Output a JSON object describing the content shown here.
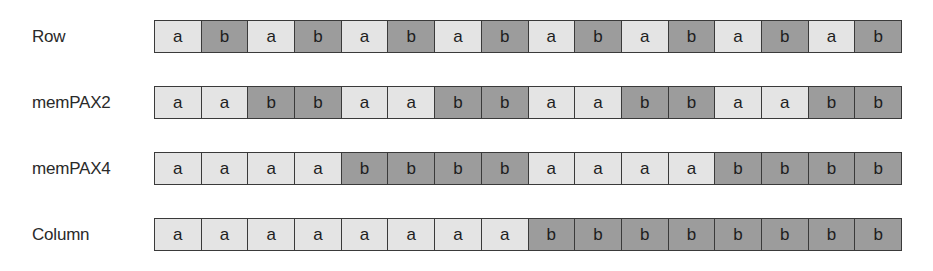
{
  "diagram": {
    "colors": {
      "a": "#e4e4e4",
      "b": "#9c9c9c",
      "border": "#3a3a3a"
    },
    "rows": [
      {
        "label": "Row",
        "cells": [
          "a",
          "b",
          "a",
          "b",
          "a",
          "b",
          "a",
          "b",
          "a",
          "b",
          "a",
          "b",
          "a",
          "b",
          "a",
          "b"
        ]
      },
      {
        "label": "memPAX2",
        "cells": [
          "a",
          "a",
          "b",
          "b",
          "a",
          "a",
          "b",
          "b",
          "a",
          "a",
          "b",
          "b",
          "a",
          "a",
          "b",
          "b"
        ]
      },
      {
        "label": "memPAX4",
        "cells": [
          "a",
          "a",
          "a",
          "a",
          "b",
          "b",
          "b",
          "b",
          "a",
          "a",
          "a",
          "a",
          "b",
          "b",
          "b",
          "b"
        ]
      },
      {
        "label": "Column",
        "cells": [
          "a",
          "a",
          "a",
          "a",
          "a",
          "a",
          "a",
          "a",
          "b",
          "b",
          "b",
          "b",
          "b",
          "b",
          "b",
          "b"
        ]
      }
    ]
  }
}
